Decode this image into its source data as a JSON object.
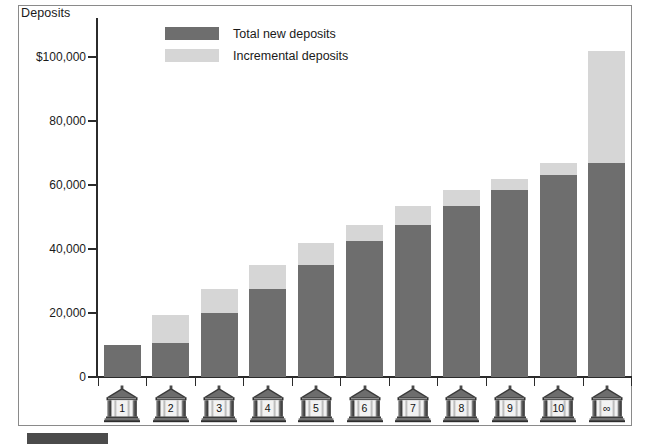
{
  "chart_data": {
    "type": "bar",
    "subtype": "stacked",
    "title": "",
    "ylabel": "Deposits",
    "xlabel": "",
    "categories": [
      "1",
      "2",
      "3",
      "4",
      "5",
      "6",
      "7",
      "8",
      "9",
      "10",
      "∞"
    ],
    "series": [
      {
        "name": "Total new deposits",
        "color": "#6e6e6e",
        "values": [
          10000,
          10500,
          20000,
          27500,
          35000,
          42500,
          47500,
          53500,
          58500,
          63000,
          67000
        ]
      },
      {
        "name": "Incremental deposits",
        "color": "#d6d6d6",
        "values": [
          0,
          9000,
          7500,
          7500,
          7000,
          5000,
          6000,
          5000,
          3500,
          4000,
          35000
        ]
      }
    ],
    "cumulative_totals": [
      10000,
      19500,
      27500,
      35000,
      42000,
      47500,
      53500,
      58500,
      62000,
      67000,
      102000
    ],
    "ylim": [
      0,
      108000
    ],
    "yticks": [
      0,
      20000,
      40000,
      60000,
      80000,
      100000
    ],
    "ytick_labels": [
      "0",
      "20,000",
      "40,000",
      "60,000",
      "80,000",
      "$100,000"
    ],
    "grid": false,
    "legend_position": "top-left-inside"
  },
  "axis": {
    "y_title": "Deposits"
  },
  "legend": {
    "items": [
      {
        "label": "Total new deposits",
        "color": "#6e6e6e"
      },
      {
        "label": "Incremental deposits",
        "color": "#d6d6d6"
      }
    ]
  },
  "x_categories": [
    {
      "label": "1",
      "icon": "bank-building-icon"
    },
    {
      "label": "2",
      "icon": "bank-building-icon"
    },
    {
      "label": "3",
      "icon": "bank-building-icon"
    },
    {
      "label": "4",
      "icon": "bank-building-icon"
    },
    {
      "label": "5",
      "icon": "bank-building-icon"
    },
    {
      "label": "6",
      "icon": "bank-building-icon"
    },
    {
      "label": "7",
      "icon": "bank-building-icon"
    },
    {
      "label": "8",
      "icon": "bank-building-icon"
    },
    {
      "label": "9",
      "icon": "bank-building-icon"
    },
    {
      "label": "10",
      "icon": "bank-building-icon"
    },
    {
      "label": "∞",
      "icon": "bank-building-icon"
    }
  ]
}
